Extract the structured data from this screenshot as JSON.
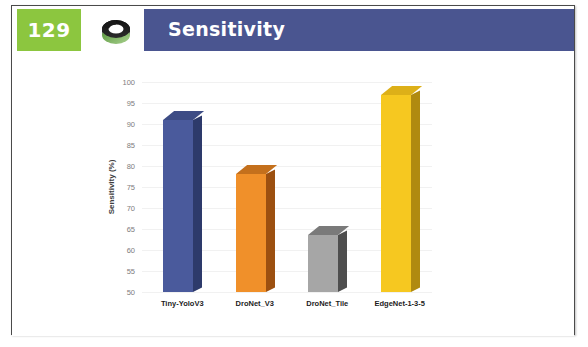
{
  "slide": {
    "page_number": "129",
    "title": "Sensitivity",
    "logo_icon": "swirl-ring-logo-icon",
    "colors": {
      "badge_green": "#8cc63f",
      "title_blue": "#4a5590",
      "frame_border": "#4a4a4a"
    }
  },
  "chart_data": {
    "type": "bar",
    "title": "",
    "xlabel": "",
    "ylabel": "Sensitivity (%)",
    "ylim": [
      50,
      100
    ],
    "ytick_step": 5,
    "yticks": [
      "100",
      "95",
      "90",
      "85",
      "80",
      "75",
      "70",
      "65",
      "60",
      "55",
      "50"
    ],
    "grid": true,
    "legend": "none",
    "three_d": true,
    "categories": [
      "Tiny-YoloV3",
      "DroNet_V3",
      "DroNet_Tile",
      "EdgeNet-1-3-5"
    ],
    "values": [
      91,
      78,
      63.5,
      97
    ],
    "series": [
      {
        "name": "Sensitivity",
        "values": [
          91,
          78,
          63.5,
          97
        ]
      }
    ],
    "bar_colors": [
      {
        "front": "#4a5a9c",
        "side": "#2d3a6b",
        "top": "#3d4c85"
      },
      {
        "front": "#f0902a",
        "side": "#9c5010",
        "top": "#c4701c"
      },
      {
        "front": "#a6a6a6",
        "side": "#4e4e4e",
        "top": "#7a7a7a"
      },
      {
        "front": "#f6c820",
        "side": "#b08a10",
        "top": "#ddb018"
      }
    ]
  }
}
